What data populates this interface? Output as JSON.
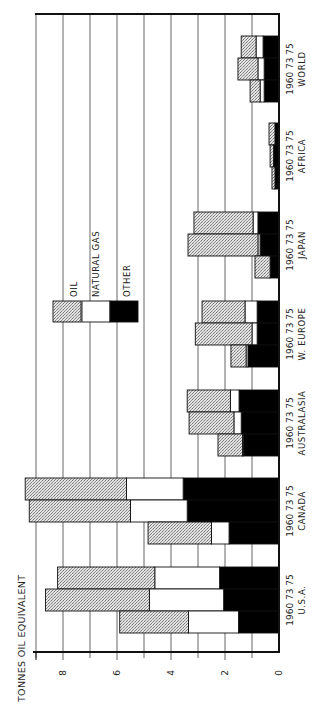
{
  "chart_data": {
    "type": "bar",
    "stacked": true,
    "orientation": "rotated-90",
    "ylabel": "TONNES OIL EQUIVALENT",
    "ylim": [
      0,
      9
    ],
    "yticks": [
      0,
      2,
      4,
      6,
      8
    ],
    "grid": true,
    "legend": {
      "position": "inside-upper-left",
      "entries": [
        {
          "name": "OIL",
          "pattern": "stipple",
          "color": "#c8c8c8"
        },
        {
          "name": "NATURAL GAS",
          "pattern": "solid",
          "color": "#ffffff"
        },
        {
          "name": "OTHER",
          "pattern": "solid",
          "color": "#000000"
        }
      ]
    },
    "year_labels": [
      "1960",
      "73",
      "75"
    ],
    "groups": [
      {
        "name": "U.S.A.",
        "years": [
          "1960",
          "73",
          "75"
        ],
        "other": [
          1.5,
          2.05,
          2.2
        ],
        "natural_gas": [
          1.85,
          2.75,
          2.4
        ],
        "oil": [
          2.55,
          3.85,
          3.6
        ]
      },
      {
        "name": "CANADA",
        "years": [
          "1960",
          "73",
          "75"
        ],
        "other": [
          1.85,
          3.4,
          3.55
        ],
        "natural_gas": [
          0.65,
          2.1,
          2.1
        ],
        "oil": [
          2.35,
          3.75,
          3.75
        ]
      },
      {
        "name": "AUSTRALASIA",
        "years": [
          "1960",
          "73",
          "75"
        ],
        "other": [
          1.33,
          1.4,
          1.48
        ],
        "natural_gas": [
          0.02,
          0.27,
          0.32
        ],
        "oil": [
          0.91,
          1.66,
          1.6
        ]
      },
      {
        "name": "W. EUROPE",
        "years": [
          "1960",
          "73",
          "75"
        ],
        "other": [
          1.15,
          0.81,
          0.81
        ],
        "natural_gas": [
          0.07,
          0.19,
          0.45
        ],
        "oil": [
          0.56,
          2.1,
          1.59
        ]
      },
      {
        "name": "JAPAN",
        "years": [
          "1960",
          "73",
          "75"
        ],
        "other": [
          0.33,
          0.7,
          0.78
        ],
        "natural_gas": [
          0.0,
          0.08,
          0.18
        ],
        "oil": [
          0.56,
          2.59,
          2.19
        ]
      },
      {
        "name": "AFRICA",
        "years": [
          "1960",
          "73",
          "75"
        ],
        "other": [
          0.15,
          0.2,
          0.15
        ],
        "natural_gas": [
          0.0,
          0.0,
          0.0
        ],
        "oil": [
          0.11,
          0.13,
          0.22
        ]
      },
      {
        "name": "WORLD",
        "years": [
          "1960",
          "73",
          "75"
        ],
        "other": [
          0.55,
          0.55,
          0.59
        ],
        "natural_gas": [
          0.15,
          0.23,
          0.26
        ],
        "oil": [
          0.37,
          0.74,
          0.55
        ]
      }
    ]
  },
  "layout": {
    "baseline_x": 279,
    "px_per_unit": 27,
    "axis_top_y": 14,
    "axis_bottom_y": 652,
    "bar_height": 22,
    "group_top_y": [
      567,
      478,
      390,
      301,
      212,
      123,
      36
    ]
  }
}
